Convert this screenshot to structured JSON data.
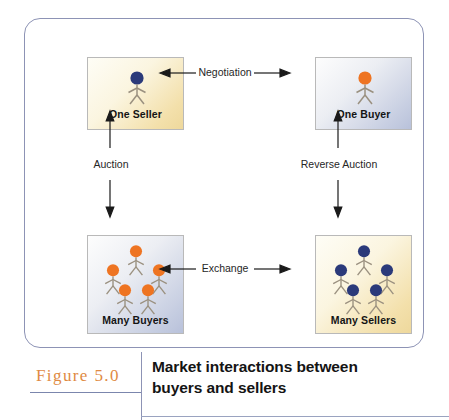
{
  "figure": {
    "number_label": "Figure 5.0",
    "caption": "Market interactions between buyers and sellers",
    "caption_line_1": "Market interactions between",
    "caption_line_2": "buyers and sellers",
    "frame_border_color": "#8d93b5",
    "number_color": "#e08a43",
    "rule_color": "#7b86ad"
  },
  "colors": {
    "buyer_head": "#ee7422",
    "seller_head": "#2b3a7a",
    "figure_limb": "#9a907f",
    "cream_box": "#f3e0ab",
    "steel_box": "#c8cfe2",
    "box_border": "#b9b9b9",
    "arrow": "#1a1a1a",
    "label_text": "#262626"
  },
  "nodes": [
    {
      "id": "one-seller",
      "label": "One Seller",
      "role": "seller",
      "count": 1,
      "head_color": "#2b3a7a",
      "fill_style": "cream-gradient",
      "position": "top-left"
    },
    {
      "id": "one-buyer",
      "label": "One Buyer",
      "role": "buyer",
      "count": 1,
      "head_color": "#ee7422",
      "fill_style": "steel-gradient",
      "position": "top-right"
    },
    {
      "id": "many-buyers",
      "label": "Many Buyers",
      "role": "buyer",
      "count": 5,
      "head_color": "#ee7422",
      "fill_style": "steel-gradient",
      "position": "bottom-left"
    },
    {
      "id": "many-sellers",
      "label": "Many Sellers",
      "role": "seller",
      "count": 5,
      "head_color": "#2b3a7a",
      "fill_style": "cream-gradient",
      "position": "bottom-right"
    }
  ],
  "connections": [
    {
      "id": "negotiation",
      "label": "Negotiation",
      "from": "one-seller",
      "to": "one-buyer",
      "orientation": "horizontal",
      "arrowheads": "both"
    },
    {
      "id": "exchange",
      "label": "Exchange",
      "from": "many-buyers",
      "to": "many-sellers",
      "orientation": "horizontal",
      "arrowheads": "both"
    },
    {
      "id": "auction",
      "label": "Auction",
      "from": "one-seller",
      "to": "many-buyers",
      "orientation": "vertical",
      "arrowheads": "both"
    },
    {
      "id": "reverse-auction",
      "label": "Reverse Auction",
      "from": "one-buyer",
      "to": "many-sellers",
      "orientation": "vertical",
      "arrowheads": "both"
    }
  ]
}
